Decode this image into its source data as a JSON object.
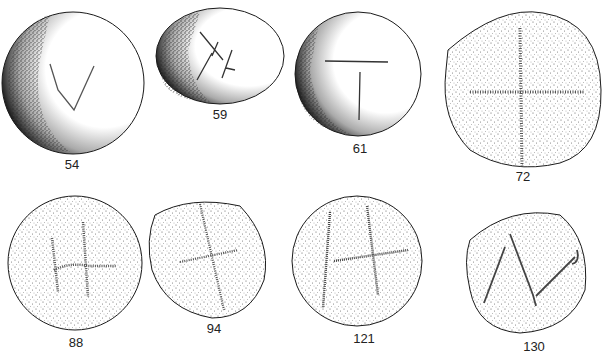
{
  "figure": {
    "items": [
      {
        "id": "54",
        "label": "54",
        "mark": "V-shaped incision",
        "shading": "dark left edge"
      },
      {
        "id": "59",
        "label": "59",
        "mark": "crossed strokes (X with slash)",
        "shading": "dark left edge"
      },
      {
        "id": "61",
        "label": "61",
        "mark": "T-shaped incision",
        "shading": "dark left edge"
      },
      {
        "id": "72",
        "label": "72",
        "mark": "cross",
        "shading": "stippled"
      },
      {
        "id": "88",
        "label": "88",
        "mark": "cross with hooked arm",
        "shading": "stippled"
      },
      {
        "id": "94",
        "label": "94",
        "mark": "oblique cross",
        "shading": "stippled"
      },
      {
        "id": "121",
        "label": "121",
        "mark": "H-like with crossbar",
        "shading": "stippled"
      },
      {
        "id": "130",
        "label": "130",
        "mark": "N-like incision",
        "shading": "stippled"
      }
    ],
    "colors": {
      "outline": "#1a1a1a",
      "stipple": "#555555",
      "background": "#ffffff"
    }
  }
}
